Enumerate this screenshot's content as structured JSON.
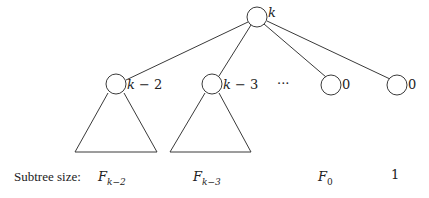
{
  "diagram": {
    "root": {
      "label": "k"
    },
    "children": [
      {
        "label": "k − 2",
        "label_var": "k",
        "label_rest": " − 2",
        "has_subtree": true,
        "size_main": "F",
        "size_sub": "k−2"
      },
      {
        "label": "k − 3",
        "label_var": "k",
        "label_rest": " − 3",
        "has_subtree": true,
        "size_main": "F",
        "size_sub": "k−3"
      },
      {
        "label": "0",
        "has_subtree": false,
        "size_main": "F",
        "size_sub": "0"
      },
      {
        "label": "0",
        "has_subtree": false,
        "size_main": "1",
        "size_sub": ""
      }
    ],
    "ellipsis": "···",
    "caption": "Subtree size:"
  }
}
